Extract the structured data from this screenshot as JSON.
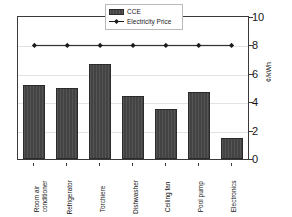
{
  "chart_data": {
    "type": "bar",
    "title": "",
    "xlabel": "",
    "ylabel": "¢/kWh",
    "ylim": [
      0,
      10
    ],
    "yticks": [
      0,
      2,
      4,
      6,
      8,
      10
    ],
    "grid": true,
    "legend_position": "top-center",
    "categories": [
      "Room air conditioner",
      "Refrigerator",
      "Torchiere",
      "Dishwasher",
      "Ceiling fan",
      "Pool pump",
      "Electronics"
    ],
    "series": [
      {
        "name": "CCE",
        "type": "bar",
        "color": "#434343",
        "values": [
          5.2,
          5.0,
          6.7,
          4.45,
          3.5,
          4.7,
          1.45
        ]
      },
      {
        "name": "Electricity Price",
        "type": "line",
        "color": "#1c1c1c",
        "marker": "diamond",
        "values": [
          8.0,
          8.0,
          8.0,
          8.0,
          8.0,
          8.0,
          8.0
        ]
      }
    ]
  },
  "legend": {
    "items": [
      {
        "label": "CCE",
        "swatch": "bar-swatch-icon"
      },
      {
        "label": "Electricity Price",
        "swatch": "line-marker-icon"
      }
    ]
  },
  "axis": {
    "y_title": "¢/kWh",
    "y_ticklabels": [
      "10",
      "8",
      "6",
      "4",
      "2",
      "0"
    ]
  },
  "x_axis": {
    "labels": [
      "Room air\nconditioner",
      "Refrigerator",
      "Torchiere",
      "Dishwasher",
      "Ceiling fan",
      "Pool pump",
      "Electronics"
    ]
  }
}
